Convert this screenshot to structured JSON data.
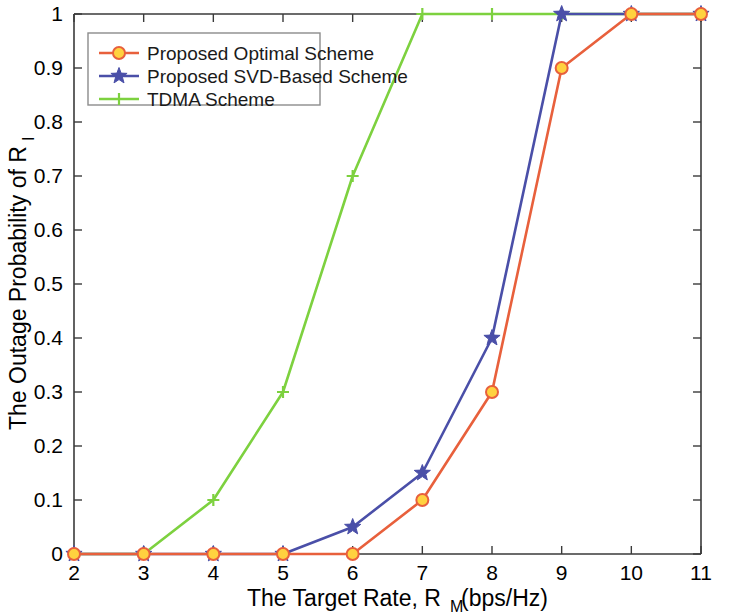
{
  "chart_data": {
    "type": "line",
    "title": "",
    "xlabel": "The Target Rate, R_M(bps/Hz)",
    "xlabel_main": "The Target Rate, R",
    "xlabel_sub": "M",
    "xlabel_tail": "(bps/Hz)",
    "ylabel": "The Outage Probability of R_I",
    "ylabel_main": "The Outage Probability of R",
    "ylabel_sub": "I",
    "x": [
      2,
      3,
      4,
      5,
      6,
      7,
      8,
      9,
      10,
      11
    ],
    "xticks": [
      "2",
      "3",
      "4",
      "5",
      "6",
      "7",
      "8",
      "9",
      "10",
      "11"
    ],
    "yticks": [
      "0",
      "0.1",
      "0.2",
      "0.3",
      "0.4",
      "0.5",
      "0.6",
      "0.7",
      "0.8",
      "0.9",
      "1"
    ],
    "ytickvalues": [
      0,
      0.1,
      0.2,
      0.3,
      0.4,
      0.5,
      0.6,
      0.7,
      0.8,
      0.9,
      1
    ],
    "xlim": [
      2,
      11
    ],
    "ylim": [
      0,
      1
    ],
    "grid": false,
    "legend_position": "upper left",
    "series": [
      {
        "name": "Proposed Optimal Scheme",
        "color": "#E8603C",
        "marker": "circle",
        "marker_fill": "#FFD23F",
        "marker_edge": "#E8603C",
        "values": [
          0,
          0,
          0,
          0,
          0,
          0.1,
          0.3,
          0.9,
          1,
          1
        ]
      },
      {
        "name": "Proposed SVD-Based Scheme",
        "color": "#4A4FA8",
        "marker": "star",
        "marker_fill": "#4A4FA8",
        "marker_edge": "#4A4FA8",
        "values": [
          0,
          0,
          0,
          0,
          0.05,
          0.15,
          0.4,
          1,
          1,
          1
        ]
      },
      {
        "name": "TDMA Scheme",
        "color": "#7DD13F",
        "marker": "plus",
        "marker_fill": "#7DD13F",
        "marker_edge": "#7DD13F",
        "values": [
          0,
          0,
          0.1,
          0.3,
          0.7,
          1,
          1,
          1,
          1,
          1
        ]
      }
    ]
  },
  "legend": {
    "items": [
      {
        "label": "Proposed Optimal Scheme"
      },
      {
        "label": "Proposed SVD-Based Scheme"
      },
      {
        "label": "TDMA Scheme"
      }
    ]
  },
  "axes": {
    "x_title_main": "The Target Rate, R",
    "x_title_sub": "M",
    "x_title_tail": "(bps/Hz)",
    "y_title_main": "The Outage Probability of R",
    "y_title_sub": "I",
    "x_tick_labels": [
      "2",
      "3",
      "4",
      "5",
      "6",
      "7",
      "8",
      "9",
      "10",
      "11"
    ],
    "y_tick_labels": [
      "0",
      "0.1",
      "0.2",
      "0.3",
      "0.4",
      "0.5",
      "0.6",
      "0.7",
      "0.8",
      "0.9",
      "1"
    ]
  }
}
